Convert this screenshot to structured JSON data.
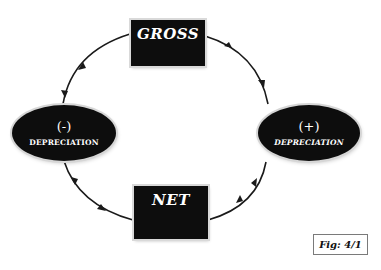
{
  "diagram": {
    "nodes": {
      "gross": {
        "label": "GROSS"
      },
      "net": {
        "label": "NET"
      },
      "minus_depreciation": {
        "sign": "(-)",
        "label": "DEPRECIATION"
      },
      "plus_depreciation": {
        "sign": "(+)",
        "label": "DEPRECIATION"
      }
    },
    "edges": [
      {
        "from": "GROSS",
        "to": "(-) DEPRECIATION"
      },
      {
        "from": "(-) DEPRECIATION",
        "to": "NET"
      },
      {
        "from": "NET",
        "to": "(+) DEPRECIATION"
      },
      {
        "from": "(+) DEPRECIATION",
        "to": "GROSS"
      }
    ],
    "figure_label": "Fig: 4/1",
    "colors": {
      "node_fill": "#0d0d0d",
      "node_text": "#ffffff",
      "line": "#1a1a1a",
      "background": "#ffffff"
    }
  }
}
